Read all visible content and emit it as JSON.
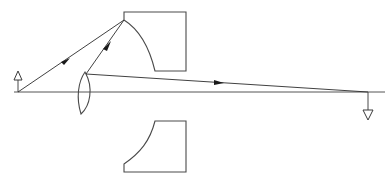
{
  "diagram": {
    "type": "ray-diagram",
    "canvas": {
      "width": 392,
      "height": 188
    },
    "colors": {
      "background": "#ffffff",
      "outline": "#4a4a4a",
      "ray": "#2b2b2b",
      "axis": "#555555",
      "arrowhead_solid": "#1a1a1a",
      "arrowhead_open_fill": "#ffffff"
    },
    "optical_axis": {
      "label": "optical-axis",
      "x1": 14,
      "y1": 92,
      "x2": 385,
      "y2": 92
    },
    "object_arrow": {
      "label": "object-arrow",
      "direction": "up",
      "x": 18,
      "base_y": 92,
      "tip_y": 72,
      "head_style": "open-triangle"
    },
    "image_arrow": {
      "label": "image-arrow",
      "direction": "down",
      "x": 368,
      "base_y": 92,
      "tip_y": 120,
      "head_style": "open-triangle"
    },
    "lens": {
      "label": "biconvex-lens",
      "center_x": 85,
      "top_y": 72,
      "bottom_y": 115,
      "left_x": 76,
      "right_x": 94
    },
    "upper_mirror": {
      "label": "concave-mirror-upper",
      "rect_left": 124,
      "rect_top": 12,
      "rect_right": 186,
      "rect_bottom": 71,
      "arc_start_x": 124,
      "arc_start_y": 20,
      "arc_end_x": 155,
      "arc_end_y": 71,
      "concavity": "lower-left"
    },
    "lower_mirror": {
      "label": "concave-mirror-lower",
      "rect_left": 124,
      "rect_top": 121,
      "rect_right": 186,
      "rect_bottom": 172,
      "arc_start_x": 155,
      "arc_start_y": 121,
      "arc_end_x": 124,
      "arc_end_y": 172,
      "concavity": "upper-left"
    },
    "rays": [
      {
        "label": "ray-object-to-mirror",
        "from_x": 18,
        "from_y": 92,
        "to_x": 124,
        "to_y": 20,
        "arrow_at_x": 66,
        "arrow_at_y": 60,
        "arrow_style": "solid"
      },
      {
        "label": "ray-lens-to-mirror",
        "from_x": 86,
        "from_y": 74,
        "to_x": 124,
        "to_y": 20,
        "arrow_at_x": 107,
        "arrow_at_y": 45,
        "arrow_style": "solid"
      },
      {
        "label": "ray-lens-to-image",
        "from_x": 86,
        "from_y": 74,
        "to_x": 368,
        "to_y": 92,
        "arrow_at_x": 218,
        "arrow_at_y": 83,
        "arrow_style": "solid"
      }
    ]
  }
}
